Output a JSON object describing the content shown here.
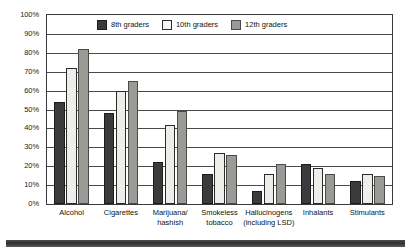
{
  "chart_data": {
    "type": "bar",
    "title": "",
    "xlabel": "",
    "ylabel": "",
    "ylim": [
      0,
      100
    ],
    "grid": true,
    "legend_position": "top-center",
    "categories": [
      "Alcohol",
      "Cigarettes",
      "Marijuana/\nhashish",
      "Smokeless\ntobacco",
      "Hallucinogens\n(including LSD)",
      "Inhalants",
      "Stimulants"
    ],
    "ytick_labels": [
      "100%",
      "90%",
      "80%",
      "70%",
      "60%",
      "50%",
      "40%",
      "30%",
      "20%",
      "10%",
      "0%"
    ],
    "ytick_values": [
      100,
      90,
      80,
      70,
      60,
      50,
      40,
      30,
      20,
      10,
      0
    ],
    "series": [
      {
        "name": "8th graders",
        "color": "#3b3b3b",
        "values": [
          54,
          48,
          22,
          16,
          7,
          21,
          12
        ]
      },
      {
        "name": "10th graders",
        "color": "#ededea",
        "values": [
          72,
          60,
          42,
          27,
          16,
          19,
          16
        ]
      },
      {
        "name": "12th graders",
        "color": "#9a9a97",
        "values": [
          82,
          65,
          49,
          26,
          21,
          16,
          15
        ]
      }
    ]
  },
  "legend": {
    "items": [
      {
        "label": "8th graders"
      },
      {
        "label": "10th graders"
      },
      {
        "label": "12th graders"
      }
    ]
  },
  "colors": {
    "series_8th": "#3b3b3b",
    "series_10th": "#ededea",
    "series_12th": "#9a9a97",
    "frame": "#3a3a3a",
    "grid": "#4a4a4a",
    "text": "#111111",
    "footer": "#2f2f2f",
    "background": "#ffffff"
  }
}
